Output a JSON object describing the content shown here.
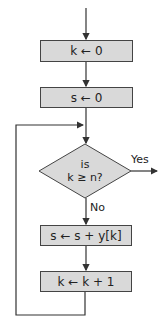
{
  "flowchart": {
    "nodes": [
      {
        "id": "init-k",
        "type": "process",
        "label": "k ← 0"
      },
      {
        "id": "init-s",
        "type": "process",
        "label": "s ← 0"
      },
      {
        "id": "check",
        "type": "decision",
        "line1": "is",
        "line2": "k ≥ n?"
      },
      {
        "id": "accumulate",
        "type": "process",
        "label": "s ← s + y[k]"
      },
      {
        "id": "increment",
        "type": "process",
        "label": "k ← k + 1"
      }
    ],
    "edges": {
      "yes_label": "Yes",
      "no_label": "No"
    },
    "colors": {
      "box_fill": "#d9d9d9",
      "stroke": "#444444"
    }
  }
}
